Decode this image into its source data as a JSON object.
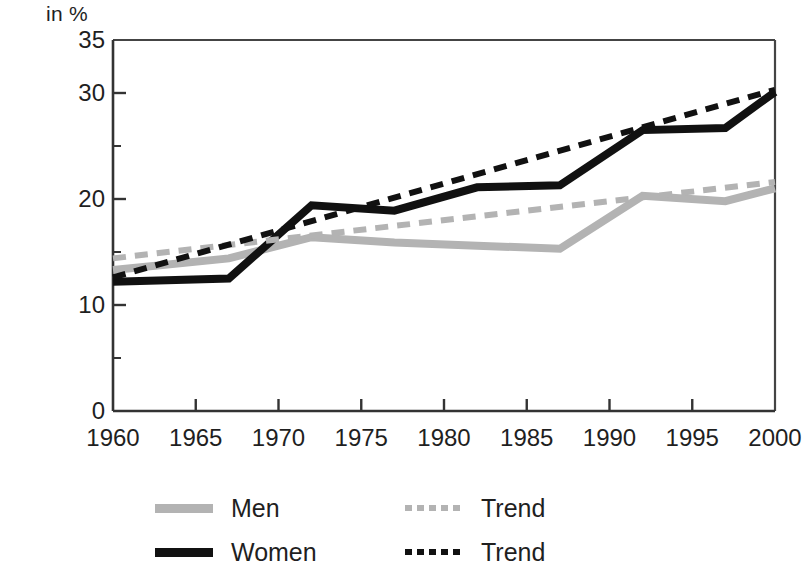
{
  "chart_data": {
    "type": "line",
    "title": "",
    "subtitle": "",
    "unit_label": "in %",
    "xlabel": "",
    "ylabel": "in %",
    "xlim": [
      1960,
      2000
    ],
    "ylim": [
      0,
      35
    ],
    "grid": false,
    "legend_position": "bottom",
    "y_ticks_major": [
      0,
      10,
      20,
      30,
      35
    ],
    "y_ticks_minor": [
      5,
      15,
      25
    ],
    "y_tick_labels": [
      "0",
      "10",
      "20",
      "30",
      "35"
    ],
    "x_ticks": [
      1960,
      1965,
      1970,
      1975,
      1980,
      1985,
      1990,
      1995,
      2000
    ],
    "x_tick_labels": [
      "1960",
      "1965",
      "1970",
      "1975",
      "1980",
      "1985",
      "1990",
      "1995",
      "2000"
    ],
    "series": [
      {
        "name": "Men",
        "style": "solid",
        "color": "#b3b3b3",
        "x": [
          1960,
          1967,
          1972,
          1977,
          1982,
          1987,
          1992,
          1997,
          2000
        ],
        "values": [
          13.3,
          14.4,
          16.4,
          15.9,
          15.6,
          15.3,
          20.3,
          19.8,
          21.0
        ]
      },
      {
        "name": "Women",
        "style": "solid",
        "color": "#111111",
        "x": [
          1960,
          1967,
          1972,
          1977,
          1982,
          1987,
          1992,
          1997,
          2000
        ],
        "values": [
          12.2,
          12.5,
          19.4,
          18.9,
          21.1,
          21.3,
          26.5,
          26.7,
          30.1
        ]
      },
      {
        "name": "Trend",
        "style": "dashed",
        "color": "#b3b3b3",
        "x": [
          1960,
          2000
        ],
        "values": [
          14.4,
          21.6
        ]
      },
      {
        "name": "Trend",
        "style": "dashed",
        "color": "#111111",
        "x": [
          1960,
          2000
        ],
        "values": [
          12.6,
          30.3
        ]
      }
    ]
  },
  "legend": {
    "rows": [
      {
        "left_label": "Men",
        "right_label": "Trend"
      },
      {
        "left_label": "Women",
        "right_label": "Trend"
      }
    ]
  }
}
